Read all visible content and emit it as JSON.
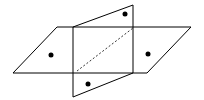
{
  "diagram": {
    "colors": {
      "stroke": "#000000",
      "fill": "#ffffff",
      "point": "#000000"
    },
    "horizontal_plane": {
      "points": "57,27 191,27 147,73 13,73"
    },
    "vertical_plane": {
      "points": "73,27 133,5 133,73 73,97"
    },
    "intersection_hidden_line": {
      "x1": 77,
      "y1": 71,
      "x2": 133,
      "y2": 28
    },
    "dots": [
      {
        "cx": 51,
        "cy": 55
      },
      {
        "cx": 125,
        "cy": 14
      },
      {
        "cx": 148,
        "cy": 54
      },
      {
        "cx": 88,
        "cy": 84
      }
    ]
  }
}
